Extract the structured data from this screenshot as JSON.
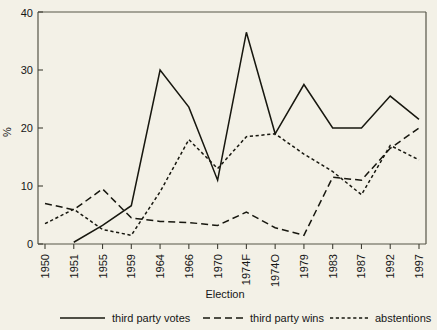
{
  "chart_data": {
    "type": "line",
    "title": "",
    "xlabel": "Election",
    "ylabel": "%",
    "ylim": [
      0,
      40
    ],
    "yticks": [
      0,
      10,
      20,
      30,
      40
    ],
    "grid": false,
    "legend_position": "bottom",
    "categories": [
      "1950",
      "1951",
      "1955",
      "1959",
      "1964",
      "1966",
      "1970",
      "1974F",
      "1974O",
      "1979",
      "1983",
      "1987",
      "1992",
      "1997"
    ],
    "series": [
      {
        "name": "third party votes",
        "style": "solid",
        "values": [
          null,
          0.3,
          3.2,
          6.6,
          30.0,
          23.6,
          11.0,
          36.5,
          19.0,
          27.5,
          20.0,
          20.0,
          25.5,
          21.5
        ]
      },
      {
        "name": "third party wins",
        "style": "dashed",
        "values": [
          7.0,
          5.9,
          9.5,
          4.5,
          3.9,
          3.7,
          3.2,
          5.5,
          2.8,
          1.5,
          11.5,
          11.0,
          16.5,
          20.0
        ]
      },
      {
        "name": "abstentions",
        "style": "dotted",
        "values": [
          3.5,
          6.0,
          2.5,
          1.5,
          9.0,
          18.0,
          13.0,
          18.5,
          19.0,
          15.5,
          12.5,
          8.5,
          17.0,
          14.5
        ]
      }
    ]
  },
  "axes": {
    "y_label": "%",
    "x_label": "Election",
    "y_tick_labels": [
      "0",
      "10",
      "20",
      "30",
      "40"
    ],
    "x_tick_labels": [
      "1950",
      "1951",
      "1955",
      "1959",
      "1964",
      "1966",
      "1970",
      "1974F",
      "1974O",
      "1979",
      "1983",
      "1987",
      "1992",
      "1997"
    ]
  },
  "legend": {
    "items": [
      {
        "label": "third party votes",
        "style": "solid"
      },
      {
        "label": "third party wins",
        "style": "dashed"
      },
      {
        "label": "abstentions",
        "style": "dotted"
      }
    ]
  },
  "colors": {
    "background": "#f3f1e7",
    "line": "#17170f",
    "frame": "#565649",
    "text": "#161616"
  }
}
